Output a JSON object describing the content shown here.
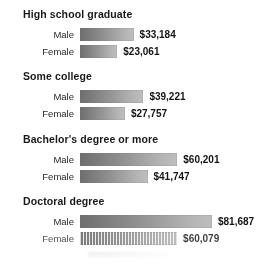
{
  "chart_data": {
    "type": "bar",
    "orientation": "horizontal",
    "title": "",
    "xlabel": "",
    "ylabel": "",
    "grid": false,
    "legend": "none",
    "value_prefix": "$",
    "axis_start": 0,
    "max_value": 81687,
    "categories": [
      "High school graduate",
      "Some college",
      "Bachelor's degree or more",
      "Doctoral degree"
    ],
    "series": [
      {
        "name": "Male",
        "values": [
          33184,
          39221,
          60201,
          81687
        ]
      },
      {
        "name": "Female",
        "values": [
          23061,
          27757,
          41747,
          60079
        ]
      }
    ],
    "groups": [
      {
        "title": "High school graduate",
        "rows": [
          {
            "label": "Male",
            "value": 33184,
            "value_label": "$33,184"
          },
          {
            "label": "Female",
            "value": 23061,
            "value_label": "$23,061"
          }
        ]
      },
      {
        "title": "Some college",
        "rows": [
          {
            "label": "Male",
            "value": 39221,
            "value_label": "$39,221"
          },
          {
            "label": "Female",
            "value": 27757,
            "value_label": "$27,757"
          }
        ]
      },
      {
        "title": "Bachelor's degree or more",
        "rows": [
          {
            "label": "Male",
            "value": 60201,
            "value_label": "$60,201"
          },
          {
            "label": "Female",
            "value": 41747,
            "value_label": "$41,747"
          }
        ]
      },
      {
        "title": "Doctoral degree",
        "rows": [
          {
            "label": "Male",
            "value": 81687,
            "value_label": "$81,687"
          },
          {
            "label": "Female",
            "value": 60079,
            "value_label": "$60,079"
          }
        ]
      }
    ],
    "colors": {
      "bar_dark": "#6e6e6e",
      "bar_light": "#bdbdbd",
      "text": "#1b1b1b",
      "background": "#fdfdfd"
    }
  }
}
